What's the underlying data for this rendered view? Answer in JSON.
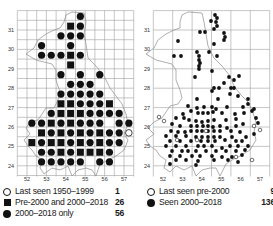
{
  "figure": {
    "left_map": {
      "x_ticks": [
        "52",
        "53",
        "54",
        "55",
        "56",
        "57"
      ],
      "y_ticks": [
        "31",
        "30",
        "29",
        "28",
        "27",
        "26",
        "25",
        "24"
      ],
      "legend": [
        {
          "symbol": "open-circle",
          "label": "Last seen 1950–1999",
          "count": "1"
        },
        {
          "symbol": "filled-square",
          "label": "Pre-2000 and 2000–2018",
          "count": "26"
        },
        {
          "symbol": "filled-circle",
          "label": "2000–2018 only",
          "count": "56"
        }
      ]
    },
    "right_map": {
      "x_ticks": [
        "52",
        "53",
        "54",
        "55",
        "56",
        "57"
      ],
      "y_ticks": [
        "31",
        "30",
        "29",
        "28",
        "27",
        "26",
        "25",
        "24"
      ],
      "legend": [
        {
          "symbol": "open-circle",
          "label": "Last seen pre-2000",
          "count": "9"
        },
        {
          "symbol": "filled-circle",
          "label": "Seen 2000–2018",
          "count": "136"
        }
      ]
    }
  },
  "colors": {
    "grid": "#9a9a9a",
    "coast": "#8a8a8a",
    "symbol": "#111111",
    "background": "#ffffff"
  }
}
